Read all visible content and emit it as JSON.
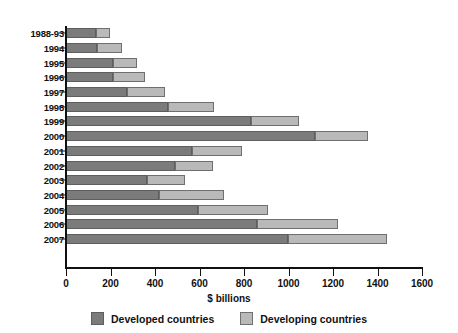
{
  "chart_data": {
    "type": "bar",
    "orientation": "horizontal",
    "stacked": true,
    "title": "",
    "xlabel": "$ billions",
    "ylabel": "",
    "xlim": [
      0,
      1600
    ],
    "xticks": [
      0,
      200,
      400,
      600,
      800,
      1000,
      1200,
      1400,
      1600
    ],
    "xtick_labels": [
      "0",
      "200",
      "400",
      "600",
      "800",
      "1000",
      "1200",
      "1400",
      "1600"
    ],
    "grid": false,
    "legend_position": "bottom",
    "categories": [
      "1988-93",
      "1994",
      "1995",
      "1996",
      "1997",
      "1998",
      "1999",
      "2000",
      "2001",
      "2002",
      "2003",
      "2004",
      "2005",
      "2006",
      "2007"
    ],
    "series": [
      {
        "name": "Developed countries",
        "color": "#7b7b7b",
        "values": [
          135,
          139,
          210,
          210,
          273,
          460,
          832,
          1120,
          567,
          490,
          364,
          418,
          593,
          859,
          998
        ]
      },
      {
        "name": "Developing countries",
        "color": "#b9b9b9",
        "values": [
          63,
          111,
          107,
          147,
          174,
          206,
          215,
          237,
          223,
          170,
          171,
          292,
          314,
          363,
          444
        ]
      }
    ],
    "totals": [
      198,
      250,
      317,
      357,
      447,
      666,
      1047,
      1357,
      790,
      660,
      535,
      710,
      907,
      1222,
      1442
    ]
  },
  "legend": {
    "items": [
      {
        "label": "Developed countries",
        "color": "#7b7b7b"
      },
      {
        "label": "Developing countries",
        "color": "#b9b9b9"
      }
    ]
  }
}
